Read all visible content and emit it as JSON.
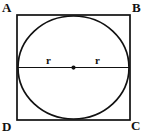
{
  "figure": {
    "kind": "geometry-diagram",
    "vertices": [
      {
        "name": "A",
        "label": "A",
        "position": "top-left"
      },
      {
        "name": "B",
        "label": "B",
        "position": "top-right"
      },
      {
        "name": "C",
        "label": "C",
        "position": "bottom-right"
      },
      {
        "name": "D",
        "label": "D",
        "position": "bottom-left"
      }
    ],
    "radius_labels": [
      {
        "label": "r",
        "side": "left"
      },
      {
        "label": "r",
        "side": "right"
      }
    ],
    "center_point": {
      "label": "",
      "marked": "true"
    },
    "colors": {
      "stroke": "#111111",
      "background": "#ffffff",
      "text": "#111111"
    },
    "geometry": {
      "square_left": 17,
      "square_top": 15,
      "square_right": 130,
      "square_bottom": 120,
      "circle_center_x": 73.5,
      "circle_center_y": 67.5,
      "circle_radius": 53,
      "diameter_y": 67.5,
      "stroke_width": 1.6
    }
  }
}
